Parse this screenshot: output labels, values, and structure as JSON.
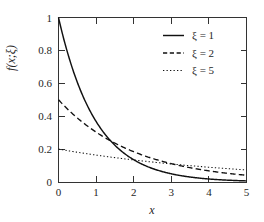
{
  "chart_data": {
    "type": "line",
    "title": "",
    "xlabel": "x",
    "ylabel": "f(x;ξ)",
    "xlim": [
      0,
      5
    ],
    "ylim": [
      0,
      1
    ],
    "grid": false,
    "legend_position": "top-right",
    "xticks": [
      "0",
      "1",
      "2",
      "3",
      "4",
      "5"
    ],
    "xtick_values": [
      0,
      1,
      2,
      3,
      4,
      5
    ],
    "yticks": [
      "0",
      "0.2",
      "0.4",
      "0.6",
      "0.8",
      "1"
    ],
    "ytick_values": [
      0,
      0.2,
      0.4,
      0.6,
      0.8,
      1
    ],
    "x": [
      0,
      0.25,
      0.5,
      0.75,
      1,
      1.25,
      1.5,
      1.75,
      2,
      2.25,
      2.5,
      2.75,
      3,
      3.25,
      3.5,
      3.75,
      4,
      4.25,
      4.5,
      4.75,
      5
    ],
    "series": [
      {
        "name": "ξ = 1",
        "style": "solid",
        "xi": 1,
        "color": "#111111",
        "values": [
          1.0,
          0.779,
          0.607,
          0.472,
          0.368,
          0.287,
          0.223,
          0.174,
          0.135,
          0.105,
          0.082,
          0.064,
          0.05,
          0.039,
          0.03,
          0.024,
          0.018,
          0.014,
          0.011,
          0.009,
          0.007
        ]
      },
      {
        "name": "ξ = 2",
        "style": "dashed",
        "xi": 2,
        "color": "#111111",
        "values": [
          0.5,
          0.441,
          0.389,
          0.344,
          0.303,
          0.268,
          0.236,
          0.208,
          0.184,
          0.162,
          0.143,
          0.127,
          0.112,
          0.099,
          0.087,
          0.077,
          0.068,
          0.06,
          0.053,
          0.047,
          0.041
        ]
      },
      {
        "name": "ξ = 5",
        "style": "dotted",
        "xi": 5,
        "color": "#111111",
        "values": [
          0.2,
          0.19,
          0.181,
          0.172,
          0.164,
          0.156,
          0.148,
          0.141,
          0.134,
          0.128,
          0.121,
          0.115,
          0.11,
          0.104,
          0.099,
          0.094,
          0.09,
          0.085,
          0.081,
          0.077,
          0.074
        ]
      }
    ],
    "equation": "f(x;ξ) = (1/ξ) e^(-x/ξ)"
  },
  "legend": {
    "entries": [
      {
        "label": "ξ = 1"
      },
      {
        "label": "ξ = 2"
      },
      {
        "label": "ξ = 5"
      }
    ]
  },
  "axes": {
    "x_title": "x",
    "y_title": "f(x;ξ)"
  },
  "colors": {
    "background": "#ffffff",
    "frame": "#333333",
    "ink": "#111111",
    "text": "#262626"
  }
}
